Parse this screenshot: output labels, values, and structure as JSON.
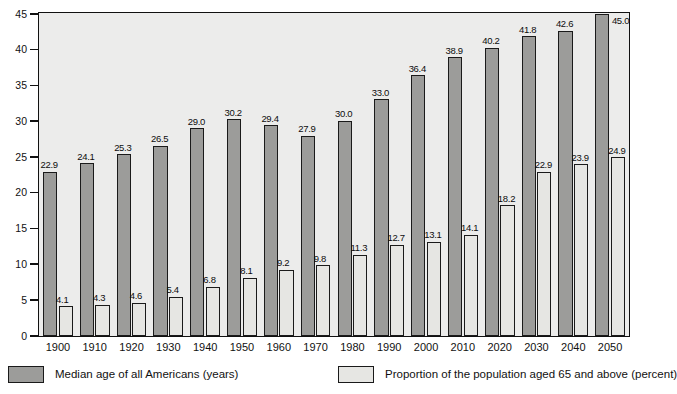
{
  "chart_data": {
    "type": "bar",
    "title": "",
    "subtitle": "",
    "xlabel": "",
    "ylabel": "",
    "ylim": [
      0,
      45
    ],
    "ytick_values": [
      0,
      5,
      10,
      15,
      20,
      25,
      30,
      35,
      40,
      45
    ],
    "ytick_labels": [
      "0",
      "5",
      "10",
      "15",
      "20",
      "25",
      "30",
      "35",
      "40",
      "45"
    ],
    "grid": false,
    "legend_position": "bottom",
    "categories": [
      "1900",
      "1910",
      "1920",
      "1930",
      "1940",
      "1950",
      "1960",
      "1970",
      "1980",
      "1990",
      "2000",
      "2010",
      "2020",
      "2030",
      "2040",
      "2050"
    ],
    "series": [
      {
        "name": "Median age of all Americans (years)",
        "color": "#9c9c9a",
        "values": [
          22.9,
          24.1,
          25.3,
          26.5,
          29.0,
          30.2,
          29.4,
          27.9,
          30.0,
          33.0,
          36.4,
          38.9,
          40.2,
          41.8,
          42.6,
          45.0
        ],
        "labels": [
          "22.9",
          "24.1",
          "25.3",
          "26.5",
          "29.0",
          "30.2",
          "29.4",
          "27.9",
          "30.0",
          "33.0",
          "36.4",
          "38.9",
          "40.2",
          "41.8",
          "42.6",
          "45.0"
        ]
      },
      {
        "name": "Proportion of the population aged 65 and above (percent)",
        "color": "#e6e6e3",
        "values": [
          4.1,
          4.3,
          4.6,
          5.4,
          6.8,
          8.1,
          9.2,
          9.8,
          11.3,
          12.7,
          13.1,
          14.1,
          18.2,
          22.9,
          23.9,
          24.9
        ],
        "labels": [
          "4.1",
          "4.3",
          "4.6",
          "5.4",
          "6.8",
          "8.1",
          "9.2",
          "9.8",
          "11.3",
          "12.7",
          "13.1",
          "14.1",
          "18.2",
          "22.9",
          "23.9",
          "24.9"
        ]
      }
    ]
  },
  "legend": {
    "items": [
      {
        "label": "Median age of all Americans (years)",
        "swatch": "median"
      },
      {
        "label": "Proportion of the population aged 65 and above (percent)",
        "swatch": "proportion"
      }
    ]
  },
  "colors": {
    "median_bar": "#9c9c9a",
    "proportion_bar": "#e6e6e3",
    "plot_background": "#ececeb",
    "axis": "#111111"
  }
}
